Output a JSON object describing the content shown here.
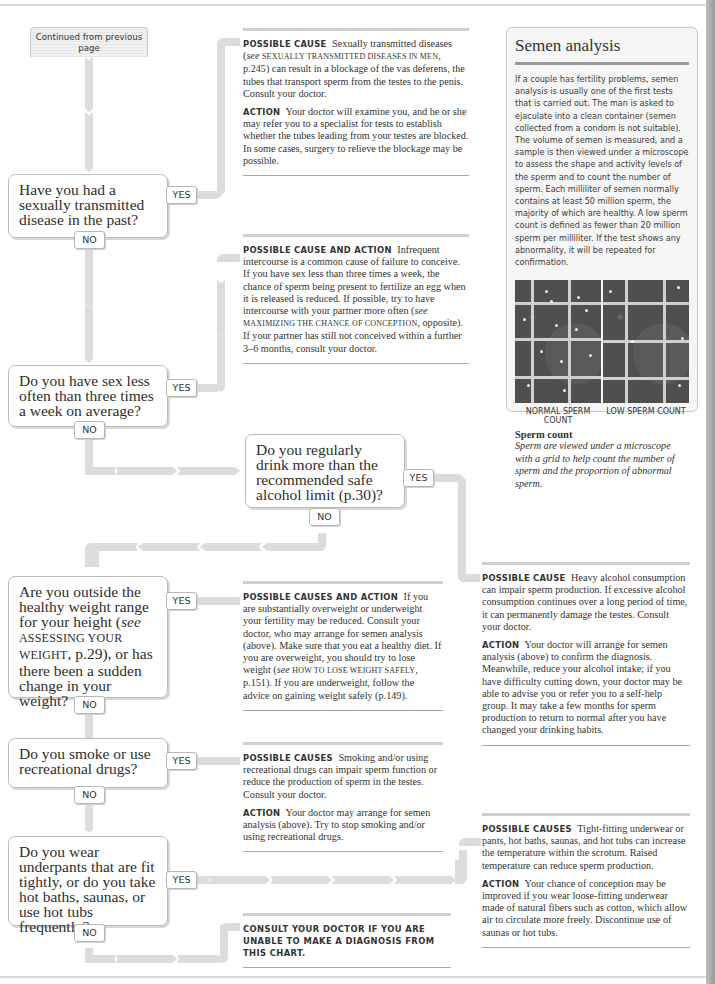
{
  "start": {
    "label": "Continued from previous page"
  },
  "questions": [
    {
      "text": "Have you had a sexually transmitted disease in the past?",
      "yes": "YES",
      "no": "NO"
    },
    {
      "text": "Do you have sex less often than three times a week on average?",
      "yes": "YES",
      "no": "NO"
    },
    {
      "text": "Do you regularly drink more than the recommended safe alcohol limit (p.30)?",
      "yes": "YES",
      "no": "NO"
    },
    {
      "text_parts": [
        "Are you outside the healthy weight range for your height (",
        "see",
        " ",
        "Assessing your weight",
        ", p.29), or has there been a sudden change in your weight?"
      ],
      "yes": "YES",
      "no": "NO"
    },
    {
      "text": "Do you smoke or use recreational drugs?",
      "yes": "YES",
      "no": "NO"
    },
    {
      "text": "Do you wear underpants that are fit tightly, or do you take hot baths, saunas, or use hot tubs frequently?",
      "yes": "YES",
      "no": "NO"
    }
  ],
  "outcomes": {
    "std": {
      "cause_label": "Possible cause",
      "cause_text_1": "Sexually transmitted diseases (",
      "cause_see": "see",
      "cause_ref": "Sexually transmitted diseases in men",
      "cause_text_2": ", p.245) can result in a blockage of the vas deferens, the tubes that transport sperm from the testes to the penis. Consult your doctor.",
      "action_label": "Action",
      "action_text": "Your doctor will examine you, and he or she may refer you to a specialist for tests to establish whether the tubes leading from your testes are blocked. In some cases, surgery to relieve the blockage may be possible."
    },
    "infrequent_sex": {
      "label": "Possible cause and action",
      "text_1": "Infrequent intercourse is a common cause of failure to conceive. If you have sex less than three times a week, the chance of sperm being present to fertilize an egg when it is released is reduced. If possible, try to have intercourse with your partner more often (",
      "see": "see",
      "ref": "Maximizing the chance of conception",
      "text_2": ", opposite). If your partner has still not conceived within a further 3–6 months, consult your doctor."
    },
    "alcohol": {
      "cause_label": "Possible cause",
      "cause_text": "Heavy alcohol consumption can impair sperm production. If excessive alcohol consumption continues over a long period of time, it can permanently damage the testes. Consult your doctor.",
      "action_label": "Action",
      "action_text": "Your doctor will arrange for semen analysis (above) to confirm the diagnosis. Meanwhile, reduce your alcohol intake; if you have difficulty cutting down, your doctor may be able to advise you or refer you to a self-help group. It may take a few months for sperm production to return to normal after you have changed your drinking habits."
    },
    "weight": {
      "label": "Possible causes and action",
      "text_1": "If you are substantially overweight or underweight your fertility may be reduced. Consult your doctor, who may arrange for semen analysis (above). Make sure that you eat a healthy diet. If you are overweight, you should try to lose weight (",
      "see": "see",
      "ref": "How to lose weight safely",
      "text_2": ", p.151). If you are underweight, follow the advice on gaining weight safely (p.149)."
    },
    "smoking": {
      "cause_label": "Possible causes",
      "cause_text": "Smoking and/or using recreational drugs can impair sperm function or reduce the production of sperm in the testes. Consult your doctor.",
      "action_label": "Action",
      "action_text": "Your doctor may arrange for semen analysis (above). Try to stop smoking and/or using recreational drugs."
    },
    "heat": {
      "cause_label": "Possible causes",
      "cause_text": "Tight-fitting underwear or pants, hot baths, saunas, and hot tubs can increase the temperature within the scrotum. Raised temperature can reduce sperm production.",
      "action_label": "Action",
      "action_text": "Your chance of conception may be improved if you wear loose-fitting underwear made of natural fibers such as cotton, which allow air to circulate more freely. Discontinue use of saunas or hot tubs."
    },
    "final": {
      "text": "Consult your doctor if you are unable to make a diagnosis from this chart."
    }
  },
  "panel": {
    "title": "Semen analysis",
    "body": "If a couple has fertility problems, semen analysis is usually one of the first tests that is carried out. The man is asked to ejaculate into a clean container (semen collected from a condom is not suitable). The volume of semen is measured, and a sample is then viewed under a microscope to assess the shape and activity levels of the sperm and to count the number of sperm. Each milliliter of semen normally contains at least 50 million sperm, the majority of which are healthy. A low sperm count is defined as fewer than 20 million sperm per milliliter. If the test shows any abnormality, it will be repeated for confirmation.",
    "images": [
      {
        "caption": "NORMAL SPERM COUNT"
      },
      {
        "caption": "LOW SPERM COUNT"
      }
    ],
    "caption_title": "Sperm count",
    "caption_text": "Sperm are viewed under a microscope with a grid to help count the number of sperm and the proportion of abnormal sperm."
  }
}
